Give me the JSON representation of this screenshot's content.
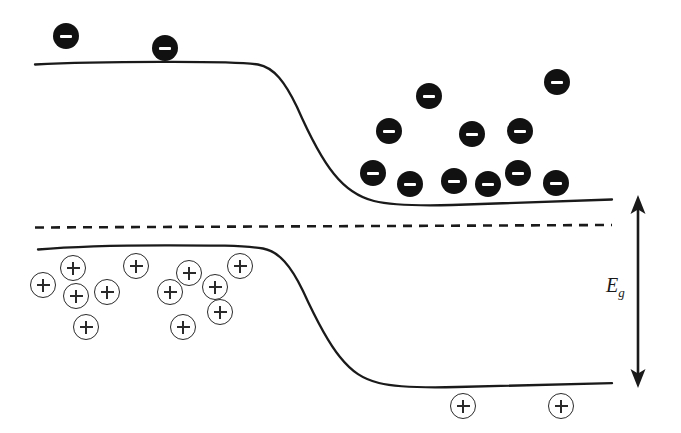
{
  "figure": {
    "background_color": "#ffffff",
    "line_color": "#1a1a1a",
    "width": 681,
    "height": 433
  },
  "labels": {
    "bandgap_symbol": "E",
    "bandgap_subscript": "g"
  },
  "chart_data": {
    "type": "line",
    "xlabel": "",
    "ylabel": "",
    "grid": false,
    "legend": null,
    "axis_ranges": {
      "x": [
        0,
        681
      ],
      "y": [
        0,
        433
      ]
    },
    "series": [
      {
        "name": "conduction-band-edge",
        "style": "solid",
        "color": "#1a1a1a",
        "linewidth": 2.2,
        "points": [
          [
            35,
            64
          ],
          [
            120,
            62
          ],
          [
            200,
            62
          ],
          [
            245,
            63
          ],
          [
            262,
            66
          ],
          [
            285,
            82
          ],
          [
            310,
            120
          ],
          [
            335,
            162
          ],
          [
            355,
            188
          ],
          [
            372,
            200
          ],
          [
            395,
            205
          ],
          [
            430,
            205
          ],
          [
            480,
            203
          ],
          [
            540,
            201
          ],
          [
            612,
            199
          ]
        ]
      },
      {
        "name": "valence-band-edge",
        "style": "solid",
        "color": "#1a1a1a",
        "linewidth": 2.2,
        "points": [
          [
            38,
            249
          ],
          [
            110,
            246
          ],
          [
            190,
            245
          ],
          [
            245,
            246
          ],
          [
            266,
            250
          ],
          [
            288,
            266
          ],
          [
            312,
            303
          ],
          [
            338,
            344
          ],
          [
            358,
            370
          ],
          [
            376,
            382
          ],
          [
            400,
            387
          ],
          [
            440,
            387
          ],
          [
            500,
            385
          ],
          [
            560,
            384
          ],
          [
            612,
            383
          ]
        ]
      },
      {
        "name": "fermi-level",
        "style": "dashed",
        "color": "#1a1a1a",
        "linewidth": 2.4,
        "dash_pattern": [
          9,
          7
        ],
        "points": [
          [
            35,
            227
          ],
          [
            612,
            225
          ]
        ]
      }
    ],
    "annotations": [
      {
        "name": "bandgap-arrow",
        "type": "double-headed-arrow",
        "orientation": "vertical",
        "x": 638,
        "y_top": 197,
        "y_bottom": 386,
        "label": "Eg",
        "color": "#1a1a1a"
      }
    ],
    "markers": {
      "electrons": {
        "symbol": "minus",
        "fill": "#111111",
        "radius": 13,
        "count": 13,
        "positions": [
          [
            66,
            36
          ],
          [
            165,
            48
          ],
          [
            429,
            96
          ],
          [
            557,
            82
          ],
          [
            389,
            131
          ],
          [
            472,
            134
          ],
          [
            520,
            131
          ],
          [
            373,
            173
          ],
          [
            410,
            184
          ],
          [
            454,
            181
          ],
          [
            488,
            184
          ],
          [
            518,
            173
          ],
          [
            556,
            183
          ]
        ]
      },
      "holes": {
        "symbol": "plus",
        "fill": "none",
        "stroke": "#2a2a2a",
        "radius": 13,
        "count": 13,
        "positions": [
          [
            43,
            285
          ],
          [
            73,
            268
          ],
          [
            76,
            296
          ],
          [
            107,
            292
          ],
          [
            136,
            266
          ],
          [
            170,
            292
          ],
          [
            189,
            273
          ],
          [
            215,
            287
          ],
          [
            240,
            266
          ],
          [
            220,
            312
          ],
          [
            86,
            327
          ],
          [
            183,
            327
          ],
          [
            463,
            406
          ],
          [
            561,
            406
          ]
        ]
      }
    }
  }
}
